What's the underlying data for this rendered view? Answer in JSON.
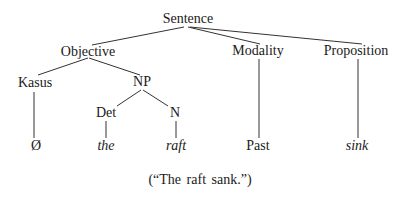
{
  "diagram": {
    "type": "syntax-tree",
    "nodes": {
      "sentence": "Sentence",
      "objective": "Objective",
      "modality": "Modality",
      "proposition": "Proposition",
      "kasus": "Kasus",
      "np": "NP",
      "det": "Det",
      "n": "N",
      "empty": "Ø",
      "the": "the",
      "raft": "raft",
      "past": "Past",
      "sink": "sink"
    },
    "edges": [
      [
        "sentence",
        "objective"
      ],
      [
        "sentence",
        "modality"
      ],
      [
        "sentence",
        "proposition"
      ],
      [
        "objective",
        "kasus"
      ],
      [
        "objective",
        "np"
      ],
      [
        "np",
        "det"
      ],
      [
        "np",
        "n"
      ],
      [
        "kasus",
        "empty"
      ],
      [
        "det",
        "the"
      ],
      [
        "n",
        "raft"
      ],
      [
        "modality",
        "past"
      ],
      [
        "proposition",
        "sink"
      ]
    ],
    "caption": "(“The raft sank.”)",
    "line_color": "#333333"
  }
}
